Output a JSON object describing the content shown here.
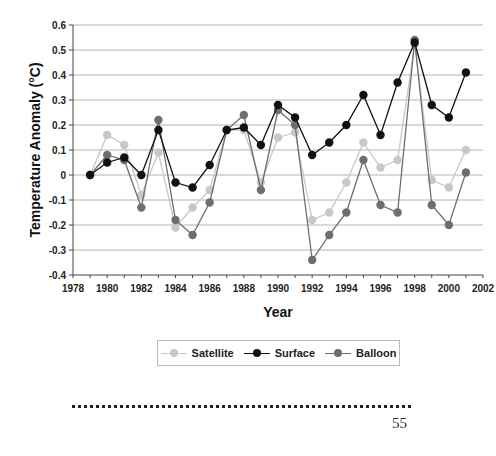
{
  "chart_data": {
    "type": "line",
    "title": "",
    "xlabel": "Year",
    "ylabel": "Temperature Anomaly (°C)",
    "xlim": [
      1978,
      2002
    ],
    "ylim": [
      -0.4,
      0.6
    ],
    "x_ticks": [
      "1978",
      "1980",
      "1982",
      "1984",
      "1986",
      "1988",
      "1990",
      "1992",
      "1994",
      "1996",
      "1998",
      "2000",
      "2002"
    ],
    "y_ticks": [
      "0.6",
      "0.5",
      "0.4",
      "0.3",
      "0.2",
      "0.1",
      "0",
      "-0.1",
      "-0.2",
      "-0.3",
      "-0.4"
    ],
    "grid": true,
    "legend_position": "bottom",
    "x": [
      1979,
      1980,
      1981,
      1982,
      1983,
      1984,
      1985,
      1986,
      1987,
      1988,
      1989,
      1990,
      1991,
      1992,
      1993,
      1994,
      1995,
      1996,
      1997,
      1998,
      1999,
      2000,
      2001
    ],
    "series": [
      {
        "name": "Satellite",
        "color": "#c8c8c8",
        "values": [
          0,
          0.16,
          0.12,
          -0.08,
          0.09,
          -0.21,
          -0.13,
          -0.06,
          0.18,
          0.18,
          -0.03,
          0.15,
          0.17,
          -0.18,
          -0.15,
          -0.03,
          0.13,
          0.03,
          0.06,
          0.52,
          -0.02,
          -0.05,
          0.1
        ]
      },
      {
        "name": "Surface",
        "color": "#111111",
        "values": [
          0,
          0.05,
          0.07,
          0.0,
          0.18,
          -0.03,
          -0.05,
          0.04,
          0.18,
          0.19,
          0.12,
          0.28,
          0.23,
          0.08,
          0.13,
          0.2,
          0.32,
          0.16,
          0.37,
          0.53,
          0.28,
          0.23,
          0.41
        ]
      },
      {
        "name": "Balloon",
        "color": "#6e6e6e",
        "values": [
          0,
          0.08,
          0.06,
          -0.13,
          0.22,
          -0.18,
          -0.24,
          -0.11,
          0.18,
          0.24,
          -0.06,
          0.26,
          0.2,
          -0.34,
          -0.24,
          -0.15,
          0.06,
          -0.12,
          -0.15,
          0.54,
          -0.12,
          -0.2,
          0.01
        ]
      }
    ]
  },
  "legend": {
    "items": [
      {
        "label": "Satellite"
      },
      {
        "label": "Surface"
      },
      {
        "label": "Balloon"
      }
    ]
  },
  "footer": {
    "page_number": "55"
  }
}
